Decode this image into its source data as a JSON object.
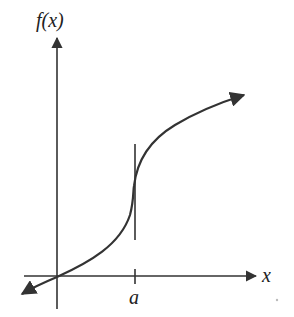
{
  "diagram": {
    "y_axis_label": "f(x)",
    "x_axis_label": "x",
    "tick_label": "a",
    "colors": {
      "stroke": "#333333",
      "background": "#ffffff"
    }
  }
}
